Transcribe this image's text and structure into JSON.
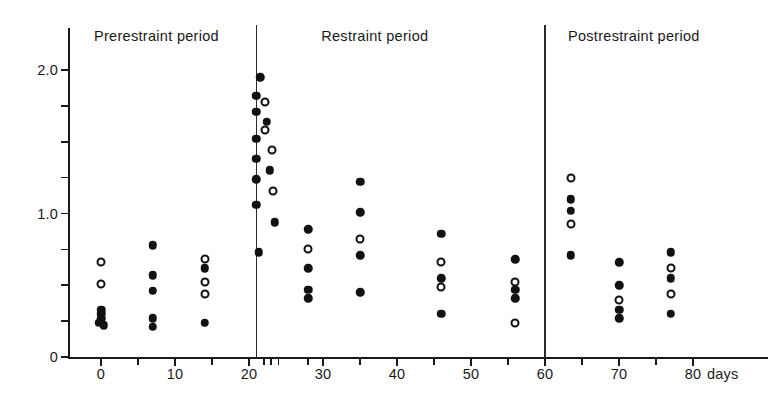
{
  "chart_data": {
    "type": "scatter",
    "title": "",
    "xlabel": "days",
    "ylabel": "",
    "xlim": [
      -6,
      84
    ],
    "ylim": [
      0,
      2.15
    ],
    "grid": false,
    "legend_position": "none",
    "x_ticks": [
      0,
      5,
      10,
      15,
      20,
      22,
      23,
      24,
      28,
      30,
      35,
      40,
      45,
      50,
      55,
      60,
      65,
      70,
      75,
      80
    ],
    "x_tick_labels": [
      "0",
      "10",
      "20",
      "30",
      "40",
      "50",
      "60",
      "70",
      "80"
    ],
    "x_tick_label_values": [
      0,
      10,
      20,
      30,
      40,
      50,
      60,
      70,
      80
    ],
    "x_unit_label": "days",
    "y_ticks": [
      0,
      0.25,
      0.5,
      0.75,
      1.0,
      1.25,
      1.5,
      1.75,
      2.0
    ],
    "y_tick_labels": [
      "0",
      "1.0",
      "2.0"
    ],
    "y_tick_label_values": [
      0,
      1.0,
      2.0
    ],
    "period_dividers": [
      21,
      60
    ],
    "periods": [
      {
        "label": "Prerestraint period",
        "center_day": 7.5
      },
      {
        "label": "Restraint period",
        "center_day": 37
      },
      {
        "label": "Postrestraint period",
        "center_day": 72
      }
    ],
    "marker_types": [
      "filled",
      "open"
    ],
    "series": [
      {
        "name": "filled",
        "marker": "filled",
        "points": [
          {
            "x": 0,
            "y": 0.33
          },
          {
            "x": 0,
            "y": 0.3
          },
          {
            "x": 0,
            "y": 0.27
          },
          {
            "x": -0.3,
            "y": 0.24
          },
          {
            "x": 0.4,
            "y": 0.22
          },
          {
            "x": 7,
            "y": 0.78
          },
          {
            "x": 7,
            "y": 0.57
          },
          {
            "x": 7,
            "y": 0.46
          },
          {
            "x": 7,
            "y": 0.27
          },
          {
            "x": 7,
            "y": 0.21
          },
          {
            "x": 14,
            "y": 0.62
          },
          {
            "x": 14,
            "y": 0.24
          },
          {
            "x": 21,
            "y": 1.82
          },
          {
            "x": 21,
            "y": 1.71
          },
          {
            "x": 21,
            "y": 1.52
          },
          {
            "x": 21,
            "y": 1.38
          },
          {
            "x": 21,
            "y": 1.24
          },
          {
            "x": 21,
            "y": 1.06
          },
          {
            "x": 21.5,
            "y": 1.95
          },
          {
            "x": 21.3,
            "y": 0.73
          },
          {
            "x": 22.4,
            "y": 1.64
          },
          {
            "x": 22.8,
            "y": 1.3
          },
          {
            "x": 23.5,
            "y": 0.94
          },
          {
            "x": 28,
            "y": 0.89
          },
          {
            "x": 28,
            "y": 0.62
          },
          {
            "x": 28,
            "y": 0.47
          },
          {
            "x": 28,
            "y": 0.41
          },
          {
            "x": 35,
            "y": 1.22
          },
          {
            "x": 35,
            "y": 1.01
          },
          {
            "x": 35,
            "y": 0.71
          },
          {
            "x": 35,
            "y": 0.45
          },
          {
            "x": 46,
            "y": 0.86
          },
          {
            "x": 46,
            "y": 0.55
          },
          {
            "x": 46,
            "y": 0.3
          },
          {
            "x": 56,
            "y": 0.68
          },
          {
            "x": 56,
            "y": 0.47
          },
          {
            "x": 56,
            "y": 0.41
          },
          {
            "x": 63.5,
            "y": 1.1
          },
          {
            "x": 63.5,
            "y": 1.02
          },
          {
            "x": 63.5,
            "y": 0.71
          },
          {
            "x": 70,
            "y": 0.66
          },
          {
            "x": 70,
            "y": 0.5
          },
          {
            "x": 70,
            "y": 0.33
          },
          {
            "x": 70,
            "y": 0.27
          },
          {
            "x": 77,
            "y": 0.73
          },
          {
            "x": 77,
            "y": 0.55
          },
          {
            "x": 77,
            "y": 0.3
          }
        ]
      },
      {
        "name": "open",
        "marker": "open",
        "points": [
          {
            "x": 0,
            "y": 0.66
          },
          {
            "x": 0,
            "y": 0.51
          },
          {
            "x": 14,
            "y": 0.68
          },
          {
            "x": 14,
            "y": 0.52
          },
          {
            "x": 14,
            "y": 0.44
          },
          {
            "x": 22.2,
            "y": 1.78
          },
          {
            "x": 22.2,
            "y": 1.58
          },
          {
            "x": 23.1,
            "y": 1.44
          },
          {
            "x": 23.3,
            "y": 1.16
          },
          {
            "x": 28,
            "y": 0.75
          },
          {
            "x": 35,
            "y": 0.82
          },
          {
            "x": 46,
            "y": 0.66
          },
          {
            "x": 46,
            "y": 0.49
          },
          {
            "x": 56,
            "y": 0.52
          },
          {
            "x": 56,
            "y": 0.24
          },
          {
            "x": 63.5,
            "y": 1.25
          },
          {
            "x": 63.5,
            "y": 0.93
          },
          {
            "x": 70,
            "y": 0.4
          },
          {
            "x": 77,
            "y": 0.62
          },
          {
            "x": 77,
            "y": 0.44
          }
        ]
      }
    ]
  }
}
